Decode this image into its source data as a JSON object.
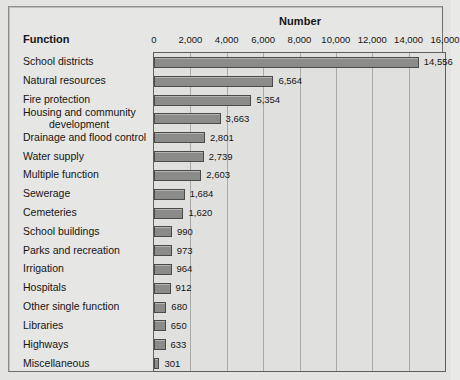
{
  "header": {
    "chart_title": "Number",
    "function_header": "Function"
  },
  "chart_data": {
    "type": "bar",
    "orientation": "horizontal",
    "title": "Number",
    "xlabel": "Number",
    "ylabel": "Function",
    "xlim": [
      0,
      16000
    ],
    "xticks": [
      0,
      2000,
      4000,
      6000,
      8000,
      10000,
      12000,
      14000,
      16000
    ],
    "xtick_labels": [
      "0",
      "2,000",
      "4,000",
      "6,000",
      "8,000",
      "10,000",
      "12,000",
      "14,000",
      "16,000"
    ],
    "grid": true,
    "legend": false,
    "bar_color": "#8b8b89",
    "bar_edge_color": "#4a4a48",
    "plot_background": "#e0e0de",
    "figure_background": "#e6e6e4",
    "categories": [
      "School districts",
      "Natural resources",
      "Fire protection",
      "Housing and community development",
      "Drainage and flood control",
      "Water supply",
      "Multiple function",
      "Sewerage",
      "Cemeteries",
      "School buildings",
      "Parks and recreation",
      "Irrigation",
      "Hospitals",
      "Other single function",
      "Libraries",
      "Highways",
      "Miscellaneous"
    ],
    "values": [
      14556,
      6564,
      5354,
      3663,
      2801,
      2739,
      2603,
      1684,
      1620,
      990,
      973,
      964,
      912,
      680,
      650,
      633,
      301
    ],
    "value_labels": [
      "14,556",
      "6,564",
      "5,354",
      "3,663",
      "2,801",
      "2,739",
      "2,603",
      "1,684",
      "1,620",
      "990",
      "973",
      "964",
      "912",
      "680",
      "650",
      "633",
      "301"
    ],
    "category_label_lines": [
      [
        "School districts"
      ],
      [
        "Natural resources"
      ],
      [
        "Fire protection"
      ],
      [
        "Housing and community",
        "development"
      ],
      [
        "Drainage and flood control"
      ],
      [
        "Water supply"
      ],
      [
        "Multiple function"
      ],
      [
        "Sewerage"
      ],
      [
        "Cemeteries"
      ],
      [
        "School buildings"
      ],
      [
        "Parks and recreation"
      ],
      [
        "Irrigation"
      ],
      [
        "Hospitals"
      ],
      [
        "Other single function"
      ],
      [
        "Libraries"
      ],
      [
        "Highways"
      ],
      [
        "Miscellaneous"
      ]
    ]
  }
}
